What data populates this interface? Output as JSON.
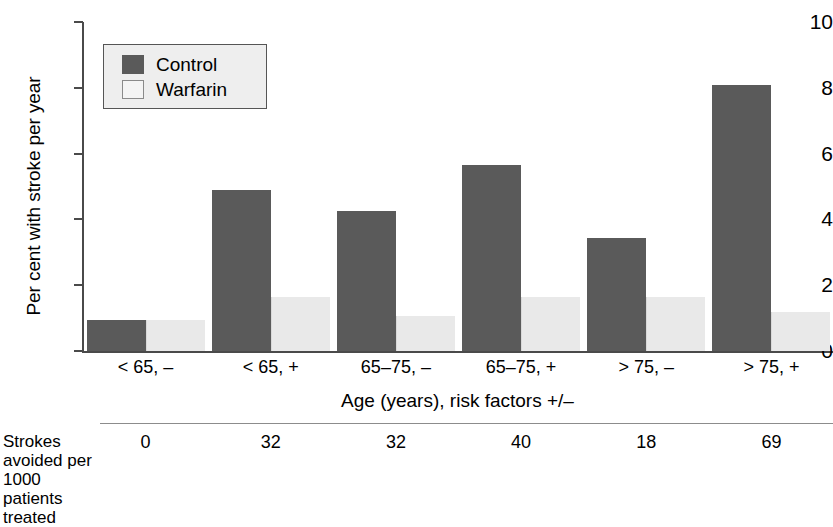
{
  "chart_data": {
    "type": "bar",
    "title": "",
    "categories": [
      "< 65, –",
      "< 65, +",
      "65–75, –",
      "65–75, +",
      "> 75, –",
      "> 75, +"
    ],
    "series": [
      {
        "name": "Control",
        "values": [
          0.95,
          4.9,
          4.25,
          5.65,
          3.45,
          8.1
        ],
        "color": "#5a5a5a"
      },
      {
        "name": "Warfarin",
        "values": [
          0.95,
          1.65,
          1.05,
          1.65,
          1.65,
          1.2
        ],
        "color": "#e9e9e9"
      }
    ],
    "xlabel": "Age (years), risk factors +/–",
    "ylabel": "Per cent with stroke per year",
    "ylim": [
      0,
      10
    ],
    "yticks": [
      0,
      2,
      4,
      6,
      8,
      10
    ],
    "ytick_labels": [
      "0",
      "2",
      "4",
      "6",
      "8",
      "10"
    ],
    "grid": false,
    "legend_position": "upper left",
    "annotation_row": {
      "label": "Strokes avoided per 1000 patients treated",
      "label_lines": [
        "Strokes",
        "avoided per",
        "1000 patients",
        "treated"
      ],
      "values": [
        "0",
        "32",
        "32",
        "40",
        "18",
        "69"
      ]
    }
  },
  "legend": {
    "entries": [
      {
        "label": "Control"
      },
      {
        "label": "Warfarin"
      }
    ]
  }
}
